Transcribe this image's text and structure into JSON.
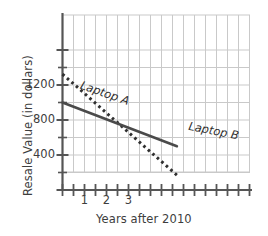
{
  "chart_data": {
    "type": "line",
    "title": "",
    "xlabel": "Years after 2010",
    "ylabel": "Resale Value (in dollars)",
    "xlim": [
      0,
      5.4
    ],
    "ylim": [
      0,
      1750
    ],
    "grid": true,
    "legend_position": "inline-labels",
    "x_tick_labels": [
      "1",
      "2",
      "3"
    ],
    "x_tick_values": [
      1,
      2,
      3
    ],
    "x_minor_tick_values": [
      0,
      0.5,
      1,
      1.5,
      2,
      2.5,
      3,
      3.5,
      4,
      4.5,
      5,
      5.4
    ],
    "y_tick_labels": [
      "400",
      "800",
      "1200"
    ],
    "y_tick_values": [
      400,
      800,
      1200
    ],
    "y_minor_tick_values": [
      0,
      200,
      400,
      600,
      800,
      1000,
      1200,
      1400,
      1600,
      1750
    ],
    "series": [
      {
        "name": "Laptop A",
        "style": "dotted",
        "color": "#2f2f2f",
        "x": [
          0,
          5.2
        ],
        "y": [
          1325,
          170
        ],
        "slope": -222,
        "intercept": 1325
      },
      {
        "name": "Laptop B",
        "style": "solid",
        "color": "#4a4a4a",
        "x": [
          0,
          5.2
        ],
        "y": [
          1000,
          500
        ],
        "slope": -96,
        "intercept": 1000
      }
    ],
    "annotations": [
      {
        "text": "Laptop A",
        "series": "Laptop A"
      },
      {
        "text": "Laptop B",
        "series": "Laptop B"
      }
    ],
    "colors": {
      "grid": "#c9c9c9",
      "axis": "#555555",
      "text": "#3d3d3d",
      "series_a": "#2f2f2f",
      "series_b": "#4a4a4a",
      "background": "#ffffff"
    }
  }
}
